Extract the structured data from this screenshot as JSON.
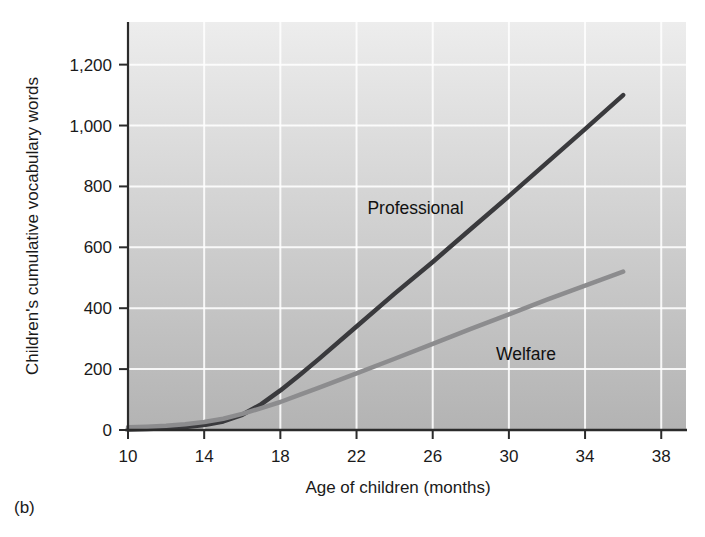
{
  "figure_label": "(b)",
  "chart_data": {
    "type": "line",
    "title": "",
    "xlabel": "Age of children (months)",
    "ylabel": "Children's cumulative vocabulary words",
    "xlim": [
      10,
      39.3
    ],
    "ylim": [
      0,
      1340
    ],
    "x_ticks": [
      10,
      14,
      18,
      22,
      26,
      30,
      34,
      38
    ],
    "x_tick_labels": [
      "10",
      "14",
      "18",
      "22",
      "26",
      "30",
      "34",
      "38"
    ],
    "y_ticks": [
      0,
      200,
      400,
      600,
      800,
      1000,
      1200
    ],
    "y_tick_labels": [
      "0",
      "200",
      "400",
      "600",
      "800",
      "1,000",
      "1,200"
    ],
    "grid": true,
    "legend_position": "inline-annotations",
    "background_gradient": [
      "#ededed",
      "#b3b3b3"
    ],
    "gridline_color": "#ffffff",
    "axis_color": "#2b2b2b",
    "series": [
      {
        "name": "Professional",
        "color": "#3a3a3d",
        "points": [
          [
            10,
            2
          ],
          [
            11,
            3
          ],
          [
            12,
            6
          ],
          [
            13,
            10
          ],
          [
            14,
            16
          ],
          [
            15,
            28
          ],
          [
            16,
            50
          ],
          [
            17,
            85
          ],
          [
            18,
            130
          ],
          [
            19,
            180
          ],
          [
            20,
            232
          ],
          [
            22,
            340
          ],
          [
            24,
            448
          ],
          [
            26,
            552
          ],
          [
            28,
            660
          ],
          [
            30,
            768
          ],
          [
            32,
            878
          ],
          [
            34,
            988
          ],
          [
            36,
            1100
          ]
        ]
      },
      {
        "name": "Welfare",
        "color": "#8c8c8e",
        "points": [
          [
            10,
            9
          ],
          [
            11,
            11
          ],
          [
            12,
            14
          ],
          [
            13,
            19
          ],
          [
            14,
            26
          ],
          [
            15,
            37
          ],
          [
            16,
            53
          ],
          [
            17,
            72
          ],
          [
            18,
            92
          ],
          [
            19,
            115
          ],
          [
            20,
            138
          ],
          [
            22,
            186
          ],
          [
            24,
            234
          ],
          [
            26,
            283
          ],
          [
            28,
            332
          ],
          [
            30,
            380
          ],
          [
            32,
            428
          ],
          [
            34,
            474
          ],
          [
            36,
            520
          ]
        ]
      }
    ],
    "annotations": [
      {
        "text": "Professional",
        "x": 25.1,
        "y": 730
      },
      {
        "text": "Welfare",
        "x": 30.9,
        "y": 248
      }
    ]
  }
}
